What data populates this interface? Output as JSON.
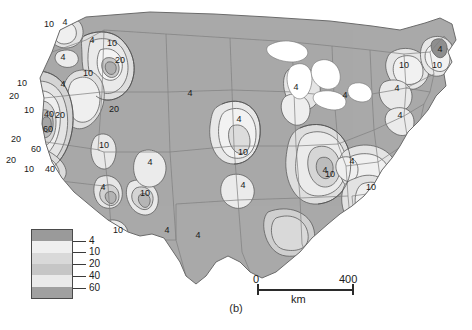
{
  "figure": {
    "caption": "(b)",
    "type": "contour-map",
    "region": "Conterminous United States"
  },
  "legend": {
    "name": "shading-legend",
    "ticks": [
      "4",
      "10",
      "20",
      "40",
      "60"
    ],
    "band_colors": [
      "#9a9a9a",
      "#efefef",
      "#d9d9d9",
      "#c6c6c6",
      "#eaeaea",
      "#a0a0a0"
    ]
  },
  "scale": {
    "name": "scale-bar",
    "min": "0",
    "max": "400",
    "units": "km"
  },
  "colors": {
    "base_land": "#a9a9a9",
    "contour_line": "#5a5a5a",
    "state_border": "#7a7a7a",
    "ocean": "#ffffff",
    "label_text": "#1a1a1a"
  },
  "chart_data": {
    "type": "contour-map",
    "title": "",
    "contour_levels": [
      4,
      10,
      20,
      40,
      60
    ],
    "contour_labels": [
      {
        "value": "10",
        "x": 49,
        "y": 27
      },
      {
        "value": "4",
        "x": 65,
        "y": 25
      },
      {
        "value": "4",
        "x": 92,
        "y": 43
      },
      {
        "value": "10",
        "x": 112,
        "y": 46
      },
      {
        "value": "20",
        "x": 120,
        "y": 63
      },
      {
        "value": "4",
        "x": 63,
        "y": 60
      },
      {
        "value": "10",
        "x": 88,
        "y": 76
      },
      {
        "value": "4",
        "x": 63,
        "y": 87
      },
      {
        "value": "10",
        "x": 22,
        "y": 86
      },
      {
        "value": "20",
        "x": 14,
        "y": 99
      },
      {
        "value": "10",
        "x": 29,
        "y": 113
      },
      {
        "value": "40",
        "x": 49,
        "y": 117
      },
      {
        "value": "20",
        "x": 60,
        "y": 118
      },
      {
        "value": "60",
        "x": 48,
        "y": 132
      },
      {
        "value": "20",
        "x": 16,
        "y": 142
      },
      {
        "value": "60",
        "x": 36,
        "y": 152
      },
      {
        "value": "20",
        "x": 11,
        "y": 163
      },
      {
        "value": "10",
        "x": 29,
        "y": 172
      },
      {
        "value": "40",
        "x": 50,
        "y": 172
      },
      {
        "value": "20",
        "x": 114,
        "y": 112
      },
      {
        "value": "10",
        "x": 104,
        "y": 148
      },
      {
        "value": "4",
        "x": 103,
        "y": 190
      },
      {
        "value": "10",
        "x": 145,
        "y": 196
      },
      {
        "value": "10",
        "x": 118,
        "y": 233
      },
      {
        "value": "4",
        "x": 167,
        "y": 233
      },
      {
        "value": "4",
        "x": 190,
        "y": 96
      },
      {
        "value": "4",
        "x": 150,
        "y": 165
      },
      {
        "value": "4",
        "x": 239,
        "y": 122
      },
      {
        "value": "10",
        "x": 243,
        "y": 155
      },
      {
        "value": "4",
        "x": 243,
        "y": 188
      },
      {
        "value": "4",
        "x": 296,
        "y": 90
      },
      {
        "value": "4",
        "x": 325,
        "y": 173
      },
      {
        "value": "10",
        "x": 330,
        "y": 177
      },
      {
        "value": "4",
        "x": 345,
        "y": 98
      },
      {
        "value": "10",
        "x": 404,
        "y": 68
      },
      {
        "value": "10",
        "x": 437,
        "y": 68
      },
      {
        "value": "4",
        "x": 440,
        "y": 52
      },
      {
        "value": "4",
        "x": 397,
        "y": 91
      },
      {
        "value": "4",
        "x": 400,
        "y": 118
      },
      {
        "value": "4",
        "x": 352,
        "y": 164
      },
      {
        "value": "10",
        "x": 371,
        "y": 190
      },
      {
        "value": "4",
        "x": 198,
        "y": 238
      }
    ]
  }
}
